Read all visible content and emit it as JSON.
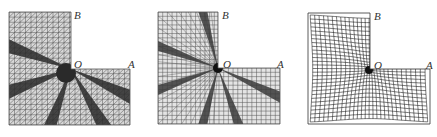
{
  "figure": {
    "panels": [
      {
        "id": "panel-1",
        "mesh_type": "triangular mesh with dark refinement bands radiating from O",
        "labels": {
          "B": "B",
          "O": "O",
          "A": "A"
        },
        "colors": {
          "mesh": "#555555",
          "band": "#2a2a2a",
          "background": "#d8d8d8"
        }
      },
      {
        "id": "panel-2",
        "mesh_type": "quadrilateral mesh with dark refinement bands radiating from O",
        "labels": {
          "B": "B",
          "O": "O",
          "A": "A"
        },
        "colors": {
          "mesh": "#555555",
          "band": "#3a3a3a",
          "background": "#e4e4e4"
        }
      },
      {
        "id": "panel-3",
        "mesh_type": "quadrilateral mesh graded toward corner O",
        "labels": {
          "B": "B",
          "O": "O",
          "A": "A"
        },
        "colors": {
          "mesh": "#222222",
          "band": "#111111",
          "background": "#ffffff"
        }
      }
    ]
  }
}
